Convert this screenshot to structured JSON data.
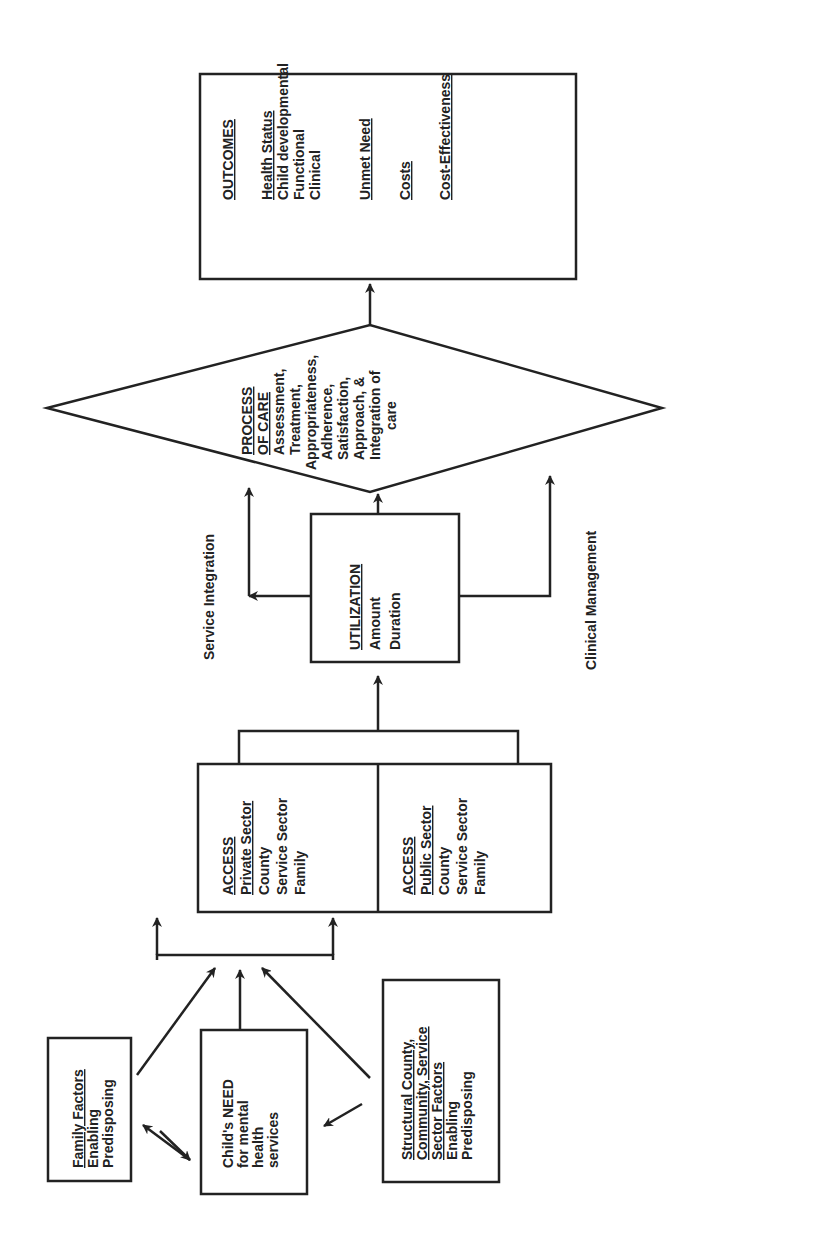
{
  "outcomes": {
    "title": "OUTCOMES",
    "health_status": "Health Status",
    "child_developmental": "Child developmental",
    "functional": "Functional",
    "clinical": "Clinical",
    "unmet_need": "Unmet Need",
    "costs": "Costs",
    "cost_effectiveness": "Cost-Effectiveness"
  },
  "process_of_care": {
    "title_line1": "PROCESS",
    "title_line2": "OF CARE",
    "lines": [
      "Assessment,",
      "Treatment,",
      "Appropriateness,",
      "Adherence,",
      "Satisfaction,",
      "Approach, &",
      "Integration of",
      "care"
    ]
  },
  "utilization": {
    "title": "UTILIZATION",
    "lines": [
      "Amount",
      "Duration"
    ]
  },
  "labels": {
    "service_integration": "Service Integration",
    "clinical_management": "Clinical Management"
  },
  "access_private": {
    "title": "ACCESS",
    "subtitle": "Private Sector",
    "lines": [
      "County",
      "Service Sector",
      "Family"
    ]
  },
  "access_public": {
    "title": "ACCESS",
    "subtitle": "Public Sector",
    "lines": [
      "County",
      "Service Sector",
      "Family"
    ]
  },
  "family_factors": {
    "title": "Family Factors",
    "lines": [
      "Enabling",
      "Predisposing"
    ]
  },
  "child_need": {
    "lines": [
      "Child's NEED",
      "for mental",
      "health",
      "services"
    ]
  },
  "structural": {
    "title_lines": [
      "Structural County,",
      "Community, Service",
      "Sector Factors"
    ],
    "lines": [
      "Enabling",
      "Predisposing"
    ]
  }
}
